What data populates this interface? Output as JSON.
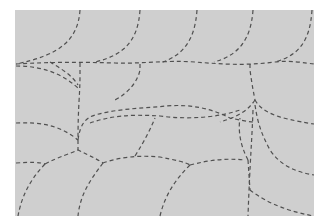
{
  "pattern": {
    "name": "dashed-scallop-pattern",
    "background": "#ffffff",
    "panel": {
      "x": 15,
      "y": 10,
      "width": 299,
      "height": 206,
      "color": "#cfcfcf"
    },
    "stroke_color": "#505050",
    "seams": [
      "M80 10 C 78 40, 60 55, 16 64",
      "M140 10 C 138 40, 125 55, 95 62",
      "M197 10 C 195 38, 185 55, 160 63",
      "M253 10 C 251 38, 240 55, 214 62",
      "M312 10 C 310 40, 300 55, 275 62",
      "M16 64 C 50 62, 80 62, 115 63 C 140 64, 165 60, 195 62 C 220 64, 245 66, 275 62 C 290 60, 305 63, 314 64",
      "M50 62 C 60 68, 72 75, 78 85",
      "M80 63 L 80 75 C 80 95, 78 105, 78 140",
      "M16 66 C 40 66, 60 72, 78 88",
      "M140 64 L 140 70 C 138 80, 130 92, 115 100",
      "M250 64 L 250 70 C 252 85, 254 95, 255 100",
      "M255 100 C 248 110, 240 116, 220 122",
      "M255 100 C 262 112, 275 118, 314 124",
      "M253 110 C 252 140, 250 160, 248 216",
      "M16 123 C 40 122, 60 125, 78 140",
      "M78 140 C 80 125, 85 118, 95 115 C 120 108, 150 108, 165 106 C 190 104, 210 108, 230 118 C 240 120, 250 122, 253 122",
      "M90 123 C 110 116, 130 114, 160 116 C 190 120, 220 117, 240 110",
      "M78 140 L 78 150",
      "M16 163 C 30 162, 40 162, 45 164",
      "M45 164 C 60 156, 70 154, 78 150 C 90 156, 95 158, 103 163",
      "M103 163 C 120 157, 140 155, 160 157 C 175 160, 185 162, 190 165",
      "M190 165 C 210 160, 225 158, 245 160",
      "M45 164 C 30 180, 22 195, 18 216",
      "M103 163 C 90 180, 80 195, 78 216",
      "M135 156 C 145 140, 150 130, 155 118",
      "M190 165 C 175 180, 165 195, 160 216",
      "M248 160 C 240 145, 238 130, 240 118",
      "M250 190 C 260 198, 280 210, 314 216",
      "M248 160 L 250 190",
      "M255 105 C 258 125, 262 135, 270 150 C 280 165, 295 172, 314 175"
    ]
  }
}
